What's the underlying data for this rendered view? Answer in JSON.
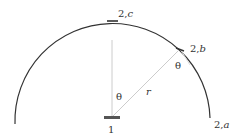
{
  "diagram": {
    "type": "geometry",
    "center_label": "1",
    "radius_label": "r",
    "angle_label_center": "θ",
    "angle_label_arc": "θ",
    "points": [
      {
        "id": "2a",
        "prefix": "2,",
        "suffix": "a"
      },
      {
        "id": "2b",
        "prefix": "2,",
        "suffix": "b"
      },
      {
        "id": "2c",
        "prefix": "2,",
        "suffix": "c"
      }
    ],
    "colors": {
      "arc": "#333333",
      "construction_lines": "#cccccc",
      "marker": "#555555",
      "text": "#333333"
    }
  }
}
